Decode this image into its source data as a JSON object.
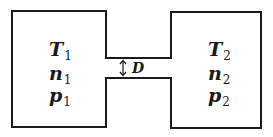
{
  "diagram": {
    "type": "two-chamber effusion setup",
    "left_chamber": {
      "labels": [
        {
          "symbol": "T",
          "subscript": "1"
        },
        {
          "symbol": "n",
          "subscript": "1"
        },
        {
          "symbol": "p",
          "subscript": "1"
        }
      ]
    },
    "right_chamber": {
      "labels": [
        {
          "symbol": "T",
          "subscript": "2"
        },
        {
          "symbol": "n",
          "subscript": "2"
        },
        {
          "symbol": "p",
          "subscript": "2"
        }
      ]
    },
    "channel": {
      "dimension_label": "D",
      "arrow_icon": "double-headed-vertical-arrow"
    },
    "colors": {
      "stroke": "#1a1a1a",
      "background": "#ffffff"
    }
  }
}
